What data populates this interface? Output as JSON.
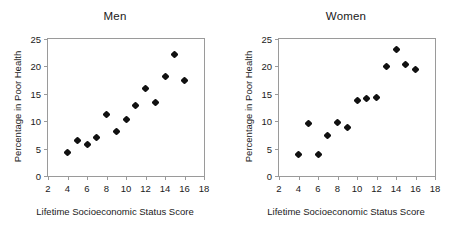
{
  "figure": {
    "background_color": "#ffffff",
    "frame_color": "#9a9a9a",
    "marker_color": "#111111"
  },
  "panels": [
    {
      "id": "men",
      "title": "Men",
      "xlabel": "Lifetime Socioeconomic Status Score",
      "ylabel": "Percentage in Poor Health",
      "xticks": [
        2,
        4,
        6,
        8,
        10,
        12,
        14,
        16,
        18
      ],
      "yticks": [
        0,
        5,
        10,
        15,
        20,
        25
      ]
    },
    {
      "id": "women",
      "title": "Women",
      "xlabel": "Lifetime Socioeconomic Status Score",
      "ylabel": "Percentage in Poor Health",
      "xticks": [
        2,
        4,
        6,
        8,
        10,
        12,
        14,
        16,
        18
      ],
      "yticks": [
        0,
        5,
        10,
        15,
        20,
        25
      ]
    }
  ],
  "chart_data": [
    {
      "type": "scatter",
      "title": "Men",
      "xlabel": "Lifetime Socioeconomic Status Score",
      "ylabel": "Percentage in Poor Health",
      "xlim": [
        2,
        18
      ],
      "ylim": [
        0,
        25
      ],
      "xticks": [
        2,
        4,
        6,
        8,
        10,
        12,
        14,
        16,
        18
      ],
      "yticks": [
        0,
        5,
        10,
        15,
        20,
        25
      ],
      "grid": false,
      "legend": null,
      "x": [
        4,
        5,
        6,
        7,
        8,
        9,
        10,
        11,
        12,
        13,
        14,
        15,
        16
      ],
      "y": [
        4.2,
        6.5,
        5.8,
        7.1,
        11.3,
        8.2,
        10.3,
        12.9,
        15.9,
        13.4,
        18.2,
        22.2,
        17.5
      ]
    },
    {
      "type": "scatter",
      "title": "Women",
      "xlabel": "Lifetime Socioeconomic Status Score",
      "ylabel": "Percentage in Poor Health",
      "xlim": [
        2,
        18
      ],
      "ylim": [
        0,
        25
      ],
      "xticks": [
        2,
        4,
        6,
        8,
        10,
        12,
        14,
        16,
        18
      ],
      "yticks": [
        0,
        5,
        10,
        15,
        20,
        25
      ],
      "grid": false,
      "legend": null,
      "x": [
        4,
        5,
        6,
        7,
        8,
        9,
        10,
        11,
        12,
        13,
        14,
        15,
        16
      ],
      "y": [
        3.9,
        9.5,
        3.9,
        7.4,
        9.8,
        8.9,
        13.8,
        14.1,
        14.4,
        20.0,
        23.1,
        20.4,
        19.4
      ]
    }
  ]
}
